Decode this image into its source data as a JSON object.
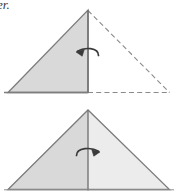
{
  "figure": {
    "type": "origami-fold-diagram",
    "caption_fragment": "er.",
    "colors": {
      "outline": "#7d7d7d",
      "fold_line": "#6e6e6e",
      "dashed_line": "#8a8a8a",
      "fill_left": "#d9d9d9",
      "fill_right": "#ececec",
      "arrow": "#3a3a3a",
      "background": "#ffffff"
    },
    "steps": [
      {
        "id": "step-top",
        "name": "fold-in-progress",
        "shape_label": "left-half triangle solid, right-half triangle dashed",
        "arrow_direction": "left",
        "arrow_label": "fold right flap to the left",
        "solid_polygon": "8,93 88,10 88,93",
        "dashed_polygon": "88,10 170,93 88,93",
        "vertices": {
          "apex": "88,10",
          "bottom_left": "8,93",
          "bottom_center": "88,93",
          "bottom_right": "170,93"
        }
      },
      {
        "id": "step-bottom",
        "name": "fold-complete",
        "shape_label": "full triangle with vertical center crease",
        "arrow_direction": "right",
        "arrow_label": "unfold or rotate to the right",
        "solid_polygon": "8,190 88,110 170,190",
        "crease_line": "88,110 88,190",
        "vertices": {
          "apex": "88,110",
          "bottom_left": "8,190",
          "bottom_center": "88,190",
          "bottom_right": "170,190"
        }
      }
    ]
  }
}
